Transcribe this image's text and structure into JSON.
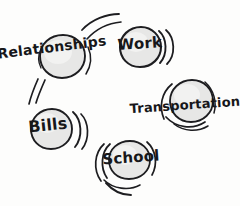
{
  "diagram": {
    "style": "hand-drawn pencil sketch",
    "background_color": "#fdfdfc",
    "ink_color": "#1d1d20",
    "circle_fill_color": "#e7e7e6",
    "nodes": [
      {
        "id": "relationships",
        "label": "Relationships",
        "center_x": 62,
        "center_y": 56,
        "radius": 23,
        "label_x": 52,
        "label_y": 48,
        "label_size": 14,
        "label_rotation": -7
      },
      {
        "id": "work",
        "label": "Work",
        "center_x": 140,
        "center_y": 46,
        "radius": 21,
        "label_x": 140,
        "label_y": 44,
        "label_size": 15,
        "label_rotation": -4
      },
      {
        "id": "transportation",
        "label": "Transportation",
        "center_x": 190,
        "center_y": 101,
        "radius": 23,
        "label_x": 185,
        "label_y": 106,
        "label_size": 13,
        "label_rotation": -4
      },
      {
        "id": "bills",
        "label": "Bills",
        "center_x": 51,
        "center_y": 128,
        "radius": 21,
        "label_x": 48,
        "label_y": 126,
        "label_size": 16,
        "label_rotation": -6
      },
      {
        "id": "school",
        "label": "School",
        "center_x": 129,
        "center_y": 160,
        "radius": 20,
        "label_x": 131,
        "label_y": 158,
        "label_size": 15,
        "label_rotation": -4
      }
    ]
  }
}
